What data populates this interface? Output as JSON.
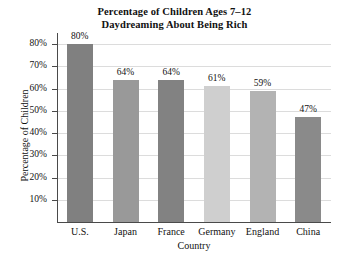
{
  "chart_data": {
    "type": "bar",
    "title": "Percentage of Children Ages 7–12 Daydreaming About Being Rich",
    "title_lines": [
      "Percentage of Children Ages 7–12",
      "Daydreaming About Being Rich"
    ],
    "xlabel": "Country",
    "ylabel": "Percentage of Children",
    "categories": [
      "U.S.",
      "Japan",
      "France",
      "Germany",
      "England",
      "China"
    ],
    "values": [
      80,
      64,
      64,
      61,
      59,
      47
    ],
    "value_labels": [
      "80%",
      "64%",
      "64%",
      "61%",
      "59%",
      "47%"
    ],
    "bar_colors": [
      "#808080",
      "#999999",
      "#828282",
      "#cfcfcf",
      "#b3b3b3",
      "#8a8a8a"
    ],
    "ylim": [
      0,
      85
    ],
    "yticks": [
      10,
      20,
      30,
      40,
      50,
      60,
      70,
      80
    ],
    "ytick_labels": [
      "10%",
      "20%",
      "30%",
      "40%",
      "50%",
      "60%",
      "70%",
      "80%"
    ],
    "grid": true,
    "grid_color": "#dcdcdc",
    "axis_color": "#4a4a4a",
    "legend": null,
    "legend_position": "none",
    "background": "#ffffff"
  }
}
